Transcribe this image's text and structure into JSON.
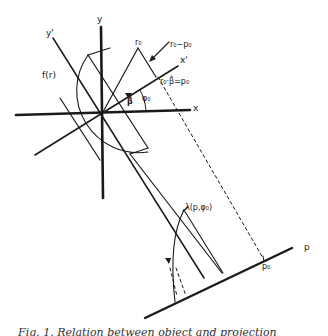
{
  "figure": {
    "labels": {
      "y_axis": "y",
      "x_axis": "x",
      "y_prime_axis": "y'",
      "x_prime_axis": "x'",
      "f_r": "f(r)",
      "r0": "r₀",
      "r0_minus_p0": "r₀−p₀",
      "r0_dot_beta": "r₀·β̂=p₀",
      "beta": "β̂",
      "phi0": "φ₀",
      "lambda": "λ(p,φ₀)",
      "p_axis": "p",
      "p0": "p₀"
    },
    "caption_partial": "Fig. 1. Relation between object and projection"
  }
}
